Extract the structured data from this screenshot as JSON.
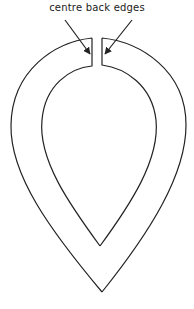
{
  "diagram": {
    "annotation": "centre back edges",
    "stroke_color": "#222222",
    "background": "#ffffff",
    "shape": "teardrop-collar-pattern"
  }
}
